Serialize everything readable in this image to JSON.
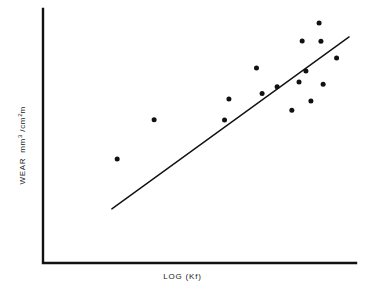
{
  "figure": {
    "background_color": "#ffffff",
    "ink_color": "#111111"
  },
  "axes": {
    "x_axis_label": "LOG (Kf)",
    "y_axis_label_prefix": "WEAR",
    "y_axis_unit_numerator": "mm",
    "y_axis_unit_numerator_exponent": "3",
    "y_axis_unit_separator": "/cm",
    "y_axis_unit_denominator_exponent": "2",
    "y_axis_unit_suffix": "m",
    "y_axis_label_plain": "WEAR mm3 /cm2m",
    "ticks_shown": false,
    "tick_labels": [],
    "gridlines": false,
    "spines": [
      "left",
      "bottom"
    ],
    "origin_px": [
      43,
      263
    ],
    "x_axis_end_px": [
      356,
      263
    ],
    "y_axis_top_px": [
      43,
      9
    ]
  },
  "chart_data": {
    "type": "scatter",
    "title": "",
    "xlabel": "LOG (Kf)",
    "ylabel": "WEAR mm3 /cm2m",
    "grid": false,
    "legend": "none",
    "xlim": [
      0,
      1
    ],
    "ylim": [
      0,
      1
    ],
    "note": "Axis values are unlabeled; x/y are normalized 0-1 fractions of the plotting box (origin at lower-left of the L-shaped axes).",
    "points": [
      {
        "x": 0.237,
        "y": 0.409
      },
      {
        "x": 0.355,
        "y": 0.564
      },
      {
        "x": 0.58,
        "y": 0.563
      },
      {
        "x": 0.594,
        "y": 0.646
      },
      {
        "x": 0.682,
        "y": 0.768
      },
      {
        "x": 0.7,
        "y": 0.667
      },
      {
        "x": 0.748,
        "y": 0.694
      },
      {
        "x": 0.795,
        "y": 0.601
      },
      {
        "x": 0.818,
        "y": 0.713
      },
      {
        "x": 0.828,
        "y": 0.874
      },
      {
        "x": 0.84,
        "y": 0.756
      },
      {
        "x": 0.856,
        "y": 0.638
      },
      {
        "x": 0.882,
        "y": 0.945
      },
      {
        "x": 0.888,
        "y": 0.873
      },
      {
        "x": 0.895,
        "y": 0.704
      },
      {
        "x": 0.938,
        "y": 0.807
      }
    ],
    "points_px": [
      {
        "x": 117,
        "y": 113
      },
      {
        "x": 154,
        "y": 73
      },
      {
        "x": 224,
        "y": 73
      },
      {
        "x": 229,
        "y": 52
      },
      {
        "x": 256,
        "y": 21
      },
      {
        "x": 262,
        "y": 47
      },
      {
        "x": 277,
        "y": 40
      },
      {
        "x": 292,
        "y": 64
      },
      {
        "x": 299,
        "y": 35
      },
      {
        "x": 302,
        "y": -6
      },
      {
        "x": 306,
        "y": 24
      },
      {
        "x": 311,
        "y": 54
      },
      {
        "x": 319,
        "y": 24
      },
      {
        "x": 321,
        "y": 1
      },
      {
        "x": 323,
        "y": 27
      },
      {
        "x": 337,
        "y": 1
      }
    ],
    "marker": {
      "shape": "circle",
      "color": "#111111",
      "size_px": 5
    },
    "fit_line": {
      "label": "",
      "color": "#111111",
      "width_px": 1.4,
      "start_px": [
        112,
        209
      ],
      "end_px": [
        349,
        37
      ],
      "start": {
        "x": 0.22,
        "y": 0.213
      },
      "end": {
        "x": 0.978,
        "y": 0.89
      }
    }
  }
}
